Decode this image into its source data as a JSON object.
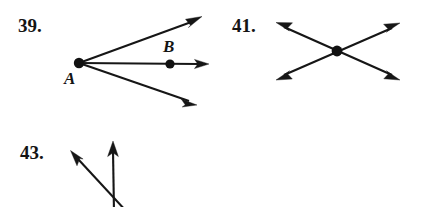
{
  "page": {
    "background_color": "#ffffff",
    "ink_color": "#161616",
    "width": 426,
    "height": 207
  },
  "problems": [
    {
      "id": "39",
      "number_label": "39.",
      "number_pos": {
        "x": 18,
        "y": 32
      },
      "vertex": {
        "name": "A",
        "x": 79,
        "y": 63,
        "r": 5.2
      },
      "vertex_label": {
        "text": "A",
        "x": 64,
        "y": 84
      },
      "interior_point": {
        "name": "B",
        "x": 170,
        "y": 64,
        "r": 4.6
      },
      "interior_point_label": {
        "text": "B",
        "x": 163,
        "y": 52
      },
      "rays": [
        {
          "name": "ray-upper",
          "x1": 79,
          "y1": 63,
          "x2": 201,
          "y2": 18
        },
        {
          "name": "ray-horizontal",
          "x1": 79,
          "y1": 63,
          "x2": 208,
          "y2": 64
        },
        {
          "name": "ray-lower",
          "x1": 79,
          "y1": 63,
          "x2": 196,
          "y2": 104
        }
      ]
    },
    {
      "id": "41",
      "number_label": "41.",
      "number_pos": {
        "x": 232,
        "y": 32
      },
      "vertex": {
        "name": "intersection",
        "x": 337,
        "y": 51,
        "r": 5.4
      },
      "rays": [
        {
          "name": "ray-upper-left",
          "x1": 337,
          "y1": 51,
          "x2": 277,
          "y2": 23
        },
        {
          "name": "ray-upper-right",
          "x1": 337,
          "y1": 51,
          "x2": 399,
          "y2": 24
        },
        {
          "name": "ray-lower-left",
          "x1": 337,
          "y1": 51,
          "x2": 277,
          "y2": 79
        },
        {
          "name": "ray-lower-right",
          "x1": 337,
          "y1": 51,
          "x2": 399,
          "y2": 79
        }
      ]
    },
    {
      "id": "43",
      "number_label": "43.",
      "number_pos": {
        "x": 20,
        "y": 159
      },
      "vertex": {
        "name": "apex",
        "x": 118,
        "y": 210,
        "r": 0
      },
      "rays": [
        {
          "name": "ray-upper-left",
          "x1": 127,
          "y1": 212,
          "x2": 72,
          "y2": 152
        },
        {
          "name": "ray-vertical",
          "x1": 114,
          "y1": 215,
          "x2": 113,
          "y2": 142
        }
      ]
    }
  ]
}
